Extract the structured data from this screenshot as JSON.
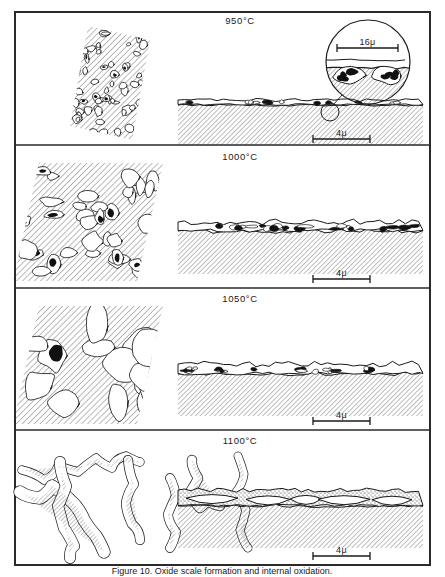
{
  "figure": {
    "name": "oxidation-microstructure-figure",
    "frame": {
      "x": 15,
      "y": 12,
      "width": 415,
      "height": 553
    },
    "dividers": [
      145,
      288,
      430
    ],
    "caption": "Figure 10. Oxide scale formation and internal oxidation."
  },
  "panels": [
    {
      "id": "panel-950",
      "temperature": "950°C",
      "title_x": 240,
      "title_y": 24,
      "plan_view": {
        "name": "plan-view-950",
        "description": "hatched parallelogram with many small outlined oxide particles",
        "cx": 113,
        "cy": 82,
        "w": 92,
        "h": 110,
        "particle_count": 62,
        "particle_size": "small",
        "fill_black_fraction": 0.08
      },
      "cross_section": {
        "name": "cross-section-950",
        "x": 178,
        "y": 96,
        "width": 245,
        "height": 36,
        "scale_thickness": 3,
        "roughness": 1.6,
        "inclusion_count": 14,
        "stipple": false
      },
      "inset": {
        "name": "magnified-inset-950",
        "cx": 368,
        "cy": 62,
        "r": 42,
        "origin_cx": 330,
        "origin_cy": 112,
        "origin_r": 9,
        "scale_bar": {
          "label": "16μ",
          "x1": 337,
          "x2": 398,
          "y": 48
        }
      },
      "scale_bar": {
        "label": "4μ",
        "x1": 313,
        "x2": 370,
        "y": 139
      }
    },
    {
      "id": "panel-1000",
      "temperature": "1000°C",
      "title_x": 240,
      "title_y": 160,
      "plan_view": {
        "name": "plan-view-1000",
        "description": "hatched field with medium irregular particles partly filled black",
        "cx": 88,
        "cy": 222,
        "w": 150,
        "h": 118,
        "particle_count": 34,
        "particle_size": "medium",
        "fill_black_fraction": 0.35
      },
      "cross_section": {
        "name": "cross-section-1000",
        "x": 178,
        "y": 218,
        "width": 245,
        "height": 42,
        "scale_thickness": 7,
        "roughness": 3.4,
        "inclusion_count": 22,
        "stipple": false
      },
      "scale_bar": {
        "label": "4μ",
        "x1": 313,
        "x2": 370,
        "y": 279
      }
    },
    {
      "id": "panel-1050",
      "temperature": "1050°C",
      "title_x": 240,
      "title_y": 302,
      "plan_view": {
        "name": "plan-view-1050",
        "description": "hatched field with large coalesced amoeboid particles",
        "cx": 88,
        "cy": 365,
        "w": 150,
        "h": 118,
        "particle_count": 16,
        "particle_size": "large",
        "fill_black_fraction": 0.22
      },
      "cross_section": {
        "name": "cross-section-1050",
        "x": 178,
        "y": 360,
        "width": 245,
        "height": 42,
        "scale_thickness": 8,
        "roughness": 3.0,
        "inclusion_count": 18,
        "stipple": false
      },
      "scale_bar": {
        "label": "4μ",
        "x1": 313,
        "x2": 370,
        "y": 421
      }
    },
    {
      "id": "panel-1100",
      "temperature": "1100°C",
      "title_x": 240,
      "title_y": 444,
      "plan_view": {
        "name": "plan-view-1100",
        "description": "interconnected hatched dendritic network strands",
        "cx": 88,
        "cy": 505,
        "w": 155,
        "h": 110,
        "particle_count": 7,
        "particle_size": "network",
        "fill_black_fraction": 0.0
      },
      "cross_section": {
        "name": "cross-section-1100",
        "x": 178,
        "y": 486,
        "width": 245,
        "height": 48,
        "scale_thickness": 14,
        "roughness": 2.4,
        "inclusion_count": 6,
        "stipple": true
      },
      "scale_bar": {
        "label": "4μ",
        "x1": 313,
        "x2": 370,
        "y": 556
      }
    }
  ],
  "colors": {
    "ink": "#1a1a1a",
    "frame": "#2a2a2a",
    "hatch": "#3a3a3a",
    "paper": "#ffffff",
    "fill_black": "#111111"
  }
}
